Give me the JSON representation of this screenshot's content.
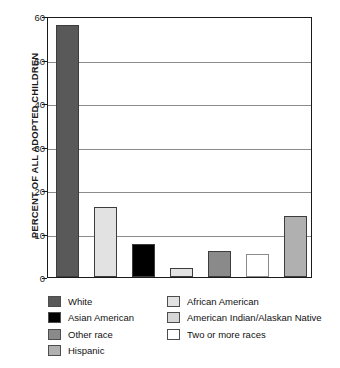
{
  "chart_data": {
    "type": "bar",
    "title": "",
    "xlabel": "",
    "ylabel": "PERCENT OF ALL ADOPTED CHILDREN",
    "ylim": [
      0,
      60
    ],
    "yticks": [
      0,
      10,
      20,
      30,
      40,
      50,
      60
    ],
    "grid": true,
    "legend_position": "bottom",
    "categories": [
      "White",
      "African American",
      "Asian American",
      "American Indian/Alaskan Native",
      "Other race",
      "Two or more races",
      "Hispanic"
    ],
    "values": [
      58,
      16,
      7.5,
      2,
      6,
      5.3,
      14
    ],
    "bar_colors": [
      "#595959",
      "#e2e2e2",
      "#000000",
      "#e2e2e2",
      "#8a8a8a",
      "#ffffff",
      "#b0b0b0"
    ]
  },
  "y_axis": {
    "title": "PERCENT OF ALL ADOPTED CHILDREN",
    "ticks": [
      "60",
      "50",
      "40",
      "30",
      "20",
      "10",
      "0"
    ]
  },
  "legend": {
    "left_column": [
      {
        "label": "White",
        "color": "#595959"
      },
      {
        "label": "Asian American",
        "color": "#000000"
      },
      {
        "label": "Other race",
        "color": "#8a8a8a"
      },
      {
        "label": "Hispanic",
        "color": "#b0b0b0"
      }
    ],
    "right_column": [
      {
        "label": "African American",
        "color": "#e2e2e2"
      },
      {
        "label": "American Indian/Alaskan Native",
        "color": "#d6d6d6"
      },
      {
        "label": "Two or more races",
        "color": "#ffffff"
      }
    ]
  }
}
